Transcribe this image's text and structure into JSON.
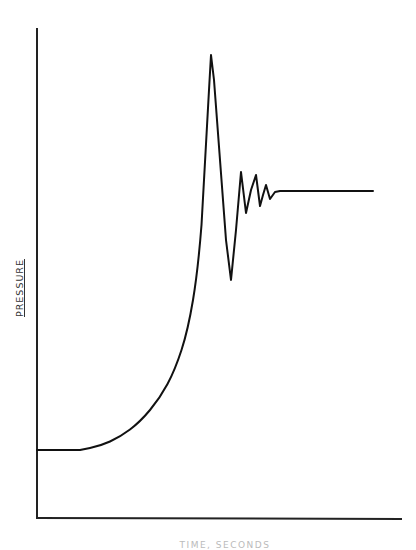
{
  "chart_data": {
    "type": "line",
    "title": "",
    "xlabel": "TIME, SECONDS",
    "ylabel": "PRESSURE",
    "grid": false,
    "legend": null,
    "x_ticks": [],
    "y_ticks": [],
    "axes_px": {
      "x0": 37,
      "y0": 518,
      "x1": 402,
      "y1": 28
    },
    "series": [
      {
        "name": "pressure",
        "points_px": [
          [
            37,
            450
          ],
          [
            80,
            450
          ],
          [
            100,
            446
          ],
          [
            120,
            437
          ],
          [
            140,
            422
          ],
          [
            160,
            398
          ],
          [
            175,
            370
          ],
          [
            188,
            330
          ],
          [
            198,
            270
          ],
          [
            205,
            180
          ],
          [
            209,
            90
          ],
          [
            211,
            55
          ],
          [
            214,
            80
          ],
          [
            220,
            160
          ],
          [
            226,
            240
          ],
          [
            231,
            280
          ],
          [
            236,
            230
          ],
          [
            241,
            172
          ],
          [
            246,
            213
          ],
          [
            251,
            190
          ],
          [
            256,
            175
          ],
          [
            260,
            206
          ],
          [
            263,
            195
          ],
          [
            266,
            185
          ],
          [
            270,
            199
          ],
          [
            275,
            192
          ],
          [
            280,
            191
          ],
          [
            373,
            191
          ]
        ],
        "normalized": {
          "x": [
            0.0,
            0.12,
            0.17,
            0.23,
            0.28,
            0.33,
            0.38,
            0.41,
            0.44,
            0.46,
            0.47,
            0.48,
            0.49,
            0.51,
            0.52,
            0.53,
            0.55,
            0.56,
            0.57,
            0.59,
            0.6,
            0.61,
            0.62,
            0.63,
            0.64,
            0.65,
            0.66,
            0.92
          ],
          "y": [
            0.14,
            0.14,
            0.15,
            0.17,
            0.2,
            0.25,
            0.3,
            0.38,
            0.51,
            0.69,
            0.87,
            0.94,
            0.89,
            0.73,
            0.57,
            0.49,
            0.59,
            0.71,
            0.62,
            0.67,
            0.7,
            0.64,
            0.66,
            0.68,
            0.65,
            0.67,
            0.67,
            0.67
          ]
        }
      }
    ]
  },
  "axes": {
    "stroke_color": "#222222",
    "line_color": "#111111"
  }
}
